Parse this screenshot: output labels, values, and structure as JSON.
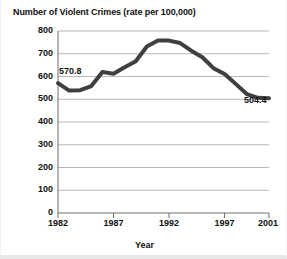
{
  "chart_data": {
    "type": "line",
    "title": "Number of Violent Crimes (rate per 100,000)",
    "xlabel": "Year",
    "ylabel": "",
    "xlim": [
      1982,
      2001
    ],
    "ylim": [
      0,
      800
    ],
    "ytick_step": 100,
    "grid": true,
    "legend": "none",
    "line_color": "#3f3f3f",
    "x": [
      1982,
      1983,
      1984,
      1985,
      1986,
      1987,
      1988,
      1989,
      1990,
      1991,
      1992,
      1993,
      1994,
      1995,
      1996,
      1997,
      1998,
      1999,
      2000,
      2001
    ],
    "values": [
      570.8,
      538.1,
      539.9,
      558.1,
      620.1,
      612.5,
      640.6,
      666.9,
      731.8,
      758.2,
      757.7,
      747.1,
      713.6,
      684.5,
      636.6,
      611.0,
      567.6,
      523.0,
      506.5,
      504.4
    ],
    "categories": [
      "1982",
      "1983",
      "1984",
      "1985",
      "1986",
      "1987",
      "1988",
      "1989",
      "1990",
      "1991",
      "1992",
      "1993",
      "1994",
      "1995",
      "1996",
      "1997",
      "1998",
      "1999",
      "2000",
      "2001"
    ],
    "ytick_labels": [
      "800",
      "700",
      "600",
      "500",
      "400",
      "300",
      "200",
      "100",
      "0"
    ],
    "ytick_values": [
      800,
      700,
      600,
      500,
      400,
      300,
      200,
      100,
      0
    ],
    "xtick_labels": [
      "1982",
      "1987",
      "1992",
      "1997",
      "2001"
    ],
    "xtick_values": [
      1982,
      1987,
      1992,
      1997,
      2001
    ],
    "annotations": [
      {
        "name": "start-value",
        "text": "570.8",
        "x": 1982,
        "y": 570.8
      },
      {
        "name": "end-value",
        "text": "504.4",
        "x": 2001,
        "y": 504.4
      }
    ]
  }
}
